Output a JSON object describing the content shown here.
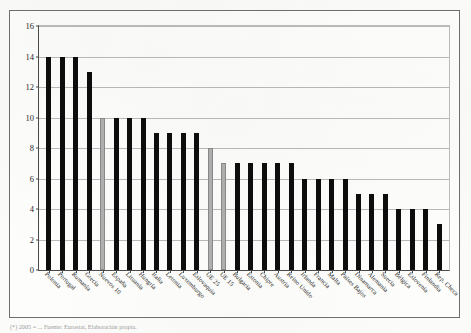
{
  "figure": {
    "footnote": "(*) 2005 = ... Fuente: Eurostat, Elaboración propia."
  },
  "chart_data": {
    "type": "bar",
    "title": "",
    "subtitle": "",
    "xlabel": "",
    "ylabel": "",
    "ylim": [
      0,
      16
    ],
    "ytick_values": [
      0,
      2,
      4,
      6,
      8,
      10,
      12,
      14,
      16
    ],
    "ytick_labels": [
      "0",
      "2",
      "4",
      "6",
      "8",
      "10",
      "12",
      "14",
      "16"
    ],
    "grid": true,
    "legend": "none",
    "bar_color": "#0d0d0d",
    "highlight_color": "#b0b0b0",
    "highlight_categories": [
      "Nuevos 10",
      "UE 25",
      "UE 15"
    ],
    "categories": [
      "Polonia",
      "Portugal",
      "Rumanía",
      "Grecia",
      "Nuevos 10",
      "España",
      "Lituania",
      "Hungría",
      "Italia",
      "Letonia",
      "Luxemburgo",
      "Eslovaquia",
      "UE 25",
      "UE 15",
      "Bulgaria",
      "Estonia",
      "Chipre",
      "Austria",
      "Reino Unido",
      "Irlanda",
      "Francia",
      "Malta",
      "Países Bajos",
      "Dinamarca",
      "Alemania",
      "Suecia",
      "Bélgica",
      "Eslovenia",
      "Finlandia",
      "Rep. Checa"
    ],
    "values": [
      14,
      14,
      14,
      13,
      10,
      10,
      10,
      10,
      9,
      9,
      9,
      9,
      8,
      7,
      7,
      7,
      7,
      7,
      7,
      6,
      6,
      6,
      6,
      5,
      5,
      5,
      4,
      4,
      4,
      3
    ]
  }
}
